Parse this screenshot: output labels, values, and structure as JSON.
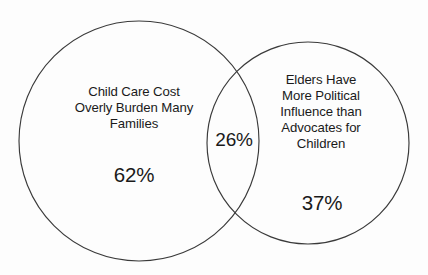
{
  "chart_data": {
    "type": "venn",
    "title": "",
    "background_color": "#fdfdfd",
    "stroke_color": "#3a3a3a",
    "text_color": "#1a1a1a",
    "sets": [
      {
        "id": "left",
        "label": "Child Care Cost\nOverly Burden Many\nFamilies",
        "value_label": "62%",
        "value": 62,
        "center_x": 139,
        "center_y": 141,
        "radius": 120
      },
      {
        "id": "right",
        "label": "Elders Have\nMore Political\nInfluence than\nAdvocates for\nChildren",
        "value_label": "37%",
        "value": 37,
        "center_x": 308,
        "center_y": 143,
        "radius": 101
      }
    ],
    "intersection": {
      "id": "both",
      "label": "",
      "value_label": "26%",
      "value": 26
    },
    "categories": [
      "Child Care Cost Overly Burden Many Families",
      "Elders Have More Political Influence than Advocates for Children",
      "Both"
    ],
    "values": [
      62,
      37,
      26
    ],
    "legend": "none",
    "grid": false
  },
  "diagram": {
    "left_set": {
      "label": "Child Care Cost\nOverly Burden Many\nFamilies",
      "value": "62%"
    },
    "right_set": {
      "label": "Elders Have\nMore Political\nInfluence than\nAdvocates for\nChildren",
      "value": "37%"
    },
    "overlap": {
      "value": "26%"
    }
  }
}
